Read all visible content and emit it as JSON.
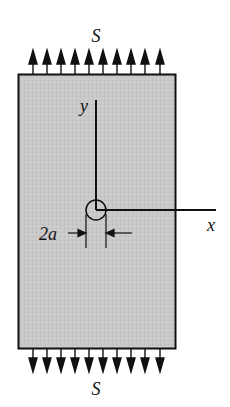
{
  "diagram": {
    "type": "plate-with-central-hole-under-uniaxial-tension",
    "labels": {
      "top_stress": "S",
      "bottom_stress": "S",
      "y_axis": "y",
      "x_axis": "x",
      "hole_dimension": "2a"
    },
    "plate": {
      "fill": "#c8c8c8",
      "stroke": "#111111",
      "x": 18,
      "y": 74,
      "width": 157,
      "height": 274
    },
    "arrows": {
      "count_top": 10,
      "count_bottom": 10,
      "x_positions": [
        33,
        47,
        61,
        75,
        89,
        103,
        117,
        131,
        145,
        160
      ]
    },
    "hole": {
      "cx": 96,
      "cy": 210,
      "r": 10
    },
    "axes": {
      "origin": [
        96,
        210
      ],
      "y_end": [
        96,
        100
      ],
      "x_end": [
        216,
        210
      ]
    }
  }
}
